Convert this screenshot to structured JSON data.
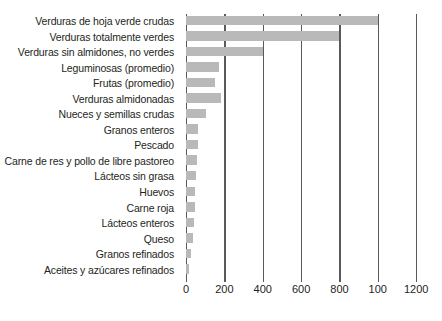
{
  "chart_data": {
    "type": "bar",
    "orientation": "horizontal",
    "title": "",
    "subtitle": "",
    "xlabel": "",
    "ylabel": "",
    "xlim": [
      0,
      1220
    ],
    "grid": true,
    "legend": null,
    "bar_color": "#b9b9b9",
    "axis_color": "#58595b",
    "background_color": "#ffffff",
    "xticks": [
      0,
      200,
      400,
      600,
      800,
      1000,
      1200
    ],
    "xtick_labels": [
      "0",
      "200",
      "400",
      "600",
      "800",
      "100",
      "1200"
    ],
    "categories": [
      "Verduras de hoja verde crudas",
      "Verduras totalmente verdes",
      "Verduras sin almidones, no verdes",
      "Leguminosas (promedio)",
      "Frutas (promedio)",
      "Verduras almidonadas",
      "Nueces y semillas crudas",
      "Granos enteros",
      "Pescado",
      "Carne de res y pollo de libre pastoreo",
      "Lácteos sin grasa",
      "Huevos",
      "Carne roja",
      "Lácteos enteros",
      "Queso",
      "Granos refinados",
      "Aceites y azúcares refinados"
    ],
    "values": [
      1000,
      800,
      400,
      170,
      150,
      180,
      105,
      65,
      62,
      55,
      52,
      48,
      45,
      42,
      35,
      28,
      18
    ]
  }
}
